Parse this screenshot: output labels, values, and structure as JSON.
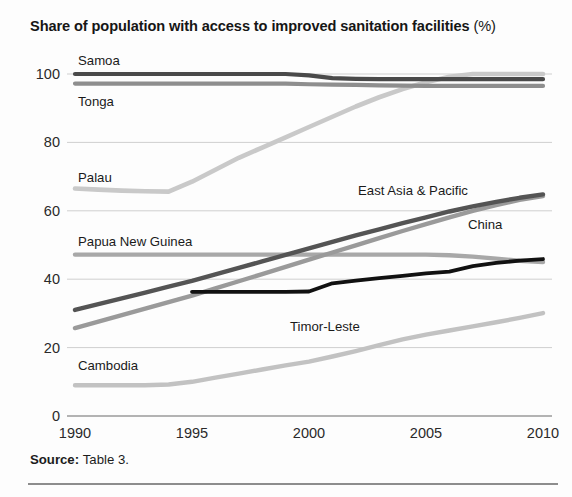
{
  "title": {
    "main": "Share of population with access to improved sanitation facilities",
    "unit": "(%)"
  },
  "footer": {
    "source_label": "Source:",
    "source_value": "Table 3."
  },
  "chart_data": {
    "type": "line",
    "xlabel": "",
    "ylabel": "",
    "xlim": [
      1990,
      2010
    ],
    "ylim": [
      0,
      100
    ],
    "x_ticks": [
      1990,
      1995,
      2000,
      2005,
      2010
    ],
    "y_ticks": [
      0,
      20,
      40,
      60,
      80,
      100
    ],
    "grid": "horizontal",
    "legend": "inline-labels",
    "colors": {
      "samoa": "#4a4a4a",
      "tonga": "#8e8e8e",
      "palau": "#c9c9c9",
      "papua_new_guinea": "#a8a8a8",
      "east_asia_pacific": "#545454",
      "china": "#9a9a9a",
      "timor_leste": "#111111",
      "cambodia": "#c2c2c2"
    },
    "x": [
      1990,
      1991,
      1992,
      1993,
      1994,
      1995,
      1996,
      1997,
      1998,
      1999,
      2000,
      2001,
      2002,
      2003,
      2004,
      2005,
      2006,
      2007,
      2008,
      2009,
      2010
    ],
    "series": [
      {
        "name": "Samoa",
        "label": "Samoa",
        "color": "#4a4a4a",
        "width": 4.2,
        "values": [
          100,
          100,
          100,
          100,
          100,
          100,
          100,
          100,
          100,
          100,
          99.6,
          98.8,
          98.6,
          98.5,
          98.5,
          98.5,
          98.5,
          98.5,
          98.5,
          98.5,
          98.5
        ]
      },
      {
        "name": "Tonga",
        "label": "Tonga",
        "color": "#8e8e8e",
        "width": 4.2,
        "values": [
          97.2,
          97.2,
          97.2,
          97.2,
          97.2,
          97.2,
          97.2,
          97.2,
          97.2,
          97.2,
          97.0,
          96.9,
          96.8,
          96.7,
          96.6,
          96.5,
          96.5,
          96.5,
          96.5,
          96.5,
          96.5
        ]
      },
      {
        "name": "Palau",
        "label": "Palau",
        "color": "#c9c9c9",
        "width": 4.6,
        "values": [
          66.5,
          66.2,
          65.9,
          65.7,
          65.6,
          68.5,
          72.0,
          75.5,
          78.5,
          81.5,
          84.5,
          87.5,
          90.5,
          93.2,
          95.6,
          97.6,
          99.2,
          100,
          100,
          100,
          100
        ]
      },
      {
        "name": "Papua New Guinea",
        "label": "Papua New Guinea",
        "color": "#a8a8a8",
        "width": 4.4,
        "values": [
          47.2,
          47.2,
          47.2,
          47.2,
          47.2,
          47.2,
          47.2,
          47.2,
          47.2,
          47.2,
          47.2,
          47.2,
          47.2,
          47.2,
          47.2,
          47.2,
          47.0,
          46.6,
          46.0,
          45.4,
          45.0
        ]
      },
      {
        "name": "East Asia & Pacific",
        "label": "East Asia & Pacific",
        "color": "#545454",
        "width": 4.4,
        "values": [
          31.0,
          32.7,
          34.4,
          36.1,
          37.8,
          39.5,
          41.4,
          43.3,
          45.2,
          47.1,
          49.0,
          50.9,
          52.8,
          54.6,
          56.4,
          58.1,
          59.8,
          61.3,
          62.6,
          63.8,
          64.8
        ]
      },
      {
        "name": "China",
        "label": "China",
        "color": "#9a9a9a",
        "width": 4.4,
        "values": [
          25.7,
          27.6,
          29.5,
          31.4,
          33.3,
          35.2,
          37.3,
          39.4,
          41.5,
          43.6,
          45.7,
          47.8,
          49.9,
          52.0,
          54.1,
          56.1,
          58.1,
          60.0,
          61.7,
          63.2,
          64.3
        ]
      },
      {
        "name": "Timor-Leste",
        "label": "Timor-Leste",
        "color": "#111111",
        "width": 3.8,
        "start_year": 1995,
        "values": [
          null,
          null,
          null,
          null,
          null,
          36.3,
          36.3,
          36.3,
          36.3,
          36.3,
          36.4,
          38.8,
          39.6,
          40.3,
          41.0,
          41.7,
          42.2,
          43.8,
          44.8,
          45.4,
          45.9
        ]
      },
      {
        "name": "Cambodia",
        "label": "Cambodia",
        "color": "#c2c2c2",
        "width": 4.4,
        "values": [
          9.0,
          9.0,
          9.0,
          9.0,
          9.2,
          10.0,
          11.2,
          12.4,
          13.6,
          14.8,
          15.9,
          17.4,
          19.0,
          20.7,
          22.4,
          23.8,
          25.0,
          26.2,
          27.4,
          28.7,
          30.1
        ]
      }
    ],
    "annotations": [
      {
        "text": "Samoa",
        "x_px": 78,
        "y_px": 65
      },
      {
        "text": "Tonga",
        "x_px": 78,
        "y_px": 106
      },
      {
        "text": "Palau",
        "x_px": 78,
        "y_px": 182
      },
      {
        "text": "Papua New Guinea",
        "x_px": 78,
        "y_px": 246
      },
      {
        "text": "East Asia & Pacific",
        "x_px": 358,
        "y_px": 195
      },
      {
        "text": "China",
        "x_px": 468,
        "y_px": 229
      },
      {
        "text": "Timor-Leste",
        "x_px": 290,
        "y_px": 331
      },
      {
        "text": "Cambodia",
        "x_px": 78,
        "y_px": 370
      }
    ]
  }
}
